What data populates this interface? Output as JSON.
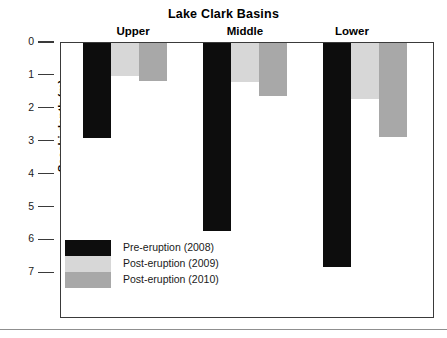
{
  "chart_data": {
    "type": "bar",
    "title": "Lake Clark Basins",
    "xlabel": "",
    "ylabel": "Secchi depth (m)",
    "categories": [
      "Upper",
      "Middle",
      "Lower"
    ],
    "series": [
      {
        "name": "Pre-eruption (2008)",
        "color": "#0d0d0d",
        "values": [
          2.9,
          5.7,
          6.8
        ]
      },
      {
        "name": "Post-eruption (2009)",
        "color": "#d7d7d7",
        "values": [
          1.0,
          1.2,
          1.7
        ]
      },
      {
        "name": "Post-eruption (2010)",
        "color": "#a8a8a8",
        "values": [
          1.15,
          1.6,
          2.85
        ]
      }
    ],
    "ylim": [
      0,
      7
    ],
    "y_axis_inverted": true,
    "yticks": [
      0,
      1,
      2,
      3,
      4,
      5,
      6,
      7
    ],
    "ytick_labels": [
      "0",
      "1",
      "2",
      "3",
      "4",
      "5",
      "6",
      "7"
    ],
    "grid": false,
    "legend_position": "inside-bottom-left",
    "frame": true
  },
  "legend": {
    "entries": [
      {
        "label": "Pre-eruption (2008)",
        "color": "#0d0d0d"
      },
      {
        "label": "Post-eruption (2009)",
        "color": "#d7d7d7"
      },
      {
        "label": "Post-eruption (2010)",
        "color": "#a8a8a8"
      }
    ]
  }
}
